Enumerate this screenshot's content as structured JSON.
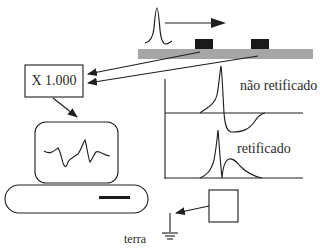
{
  "diagram": {
    "amplifier": {
      "label": "X 1.000"
    },
    "signals": {
      "unrectified_label": "não retificado",
      "rectified_label": "retificado"
    },
    "ground": {
      "label": "terra"
    },
    "colors": {
      "stroke": "#1e1e1e",
      "muscle_bar": "#a6a6a6",
      "electrode": "#1a1a1a",
      "text": "#2a2a2a"
    },
    "icons": {
      "propagation": "arrow-right",
      "electrodes": "black-rectangles",
      "ground": "ground-symbol",
      "computer": "monitor-with-waveform"
    }
  }
}
